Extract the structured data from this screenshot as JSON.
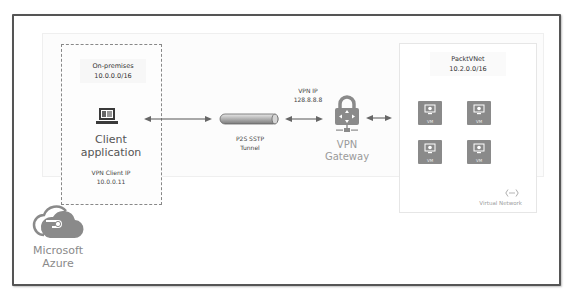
{
  "diagram": {
    "cloud": {
      "label_line1": "Microsoft",
      "label_line2": "Azure",
      "icon": "azure-cloud-icon"
    },
    "on_premises": {
      "title_line1": "On-premises",
      "title_line2": "10.0.0.0/16",
      "client": {
        "icon": "laptop-icon",
        "label_line1": "Client",
        "label_line2": "application",
        "ip_label": "VPN Client IP",
        "ip_value": "10.0.0.11"
      }
    },
    "tunnel": {
      "label_line1": "P2S SSTP",
      "label_line2": "Tunnel",
      "icon": "tunnel-pipe-icon"
    },
    "vpn_ip": {
      "label": "VPN IP",
      "value": "128.8.8.8"
    },
    "gateway": {
      "label_line1": "VPN",
      "label_line2": "Gateway",
      "icon": "vpn-gateway-lock-icon"
    },
    "vnet": {
      "title_line1": "PacktVNet",
      "title_line2": "10.2.0.0/16",
      "vms": [
        {
          "label": "VM"
        },
        {
          "label": "VM"
        },
        {
          "label": "VM"
        },
        {
          "label": "VM"
        }
      ],
      "footer_icon": "virtual-network-icon",
      "footer_label": "Virtual Network"
    },
    "connections": [
      {
        "from": "Client application",
        "to": "P2S SSTP Tunnel",
        "type": "bidirectional"
      },
      {
        "from": "P2S SSTP Tunnel",
        "to": "VPN Gateway",
        "type": "bidirectional"
      },
      {
        "from": "VPN Gateway",
        "to": "PacktVNet",
        "type": "bidirectional"
      }
    ],
    "colors": {
      "frame": "#555555",
      "icon_gray": "#8a8a8a",
      "text": "#444444",
      "muted_text": "#9a9a9a"
    }
  }
}
